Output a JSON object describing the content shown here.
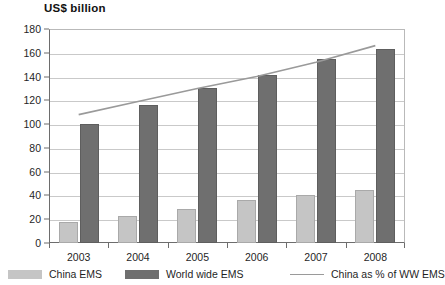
{
  "chart_data": {
    "type": "bar",
    "title": "US$ billion",
    "xlabel": "",
    "ylabel": "US$ billion",
    "ylim": [
      0,
      180
    ],
    "ytick_step": 20,
    "grid": true,
    "legend_position": "bottom",
    "categories": [
      "2003",
      "2004",
      "2005",
      "2006",
      "2007",
      "2008"
    ],
    "yticks": [
      "0",
      "20",
      "40",
      "60",
      "80",
      "100",
      "120",
      "140",
      "160",
      "180"
    ],
    "series": [
      {
        "name": "China EMS",
        "type": "bar",
        "color": "#c5c5c5",
        "values": [
          18,
          23,
          29,
          36,
          40,
          45
        ]
      },
      {
        "name": "World wide EMS",
        "type": "bar",
        "color": "#6f6f6f",
        "values": [
          100,
          116,
          130,
          141,
          155,
          163
        ]
      },
      {
        "name": "China as % of WW EMS",
        "type": "line",
        "color": "#9a9a9a",
        "values": [
          108,
          119,
          130,
          140,
          152,
          166
        ]
      }
    ]
  },
  "legend": {
    "items": [
      {
        "label": "China EMS",
        "marker": "swatch-light-gray"
      },
      {
        "label": "World wide EMS",
        "marker": "swatch-dark-gray"
      },
      {
        "label": "China as % of WW EMS",
        "marker": "line-gray"
      }
    ]
  }
}
